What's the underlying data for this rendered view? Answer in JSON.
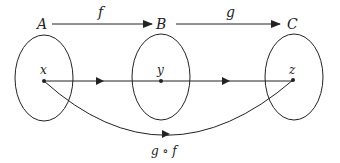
{
  "diagram": {
    "type": "function-composition",
    "sets": [
      {
        "id": "A",
        "label": "A",
        "element": "x"
      },
      {
        "id": "B",
        "label": "B",
        "element": "y"
      },
      {
        "id": "C",
        "label": "C",
        "element": "z"
      }
    ],
    "top_arrows": [
      {
        "from": "A",
        "to": "B",
        "label": "f"
      },
      {
        "from": "B",
        "to": "C",
        "label": "g"
      }
    ],
    "composition": {
      "from": "x",
      "to": "z",
      "label": "g ∘ f"
    },
    "colors": {
      "stroke": "#222222",
      "background": "#ffffff"
    }
  }
}
